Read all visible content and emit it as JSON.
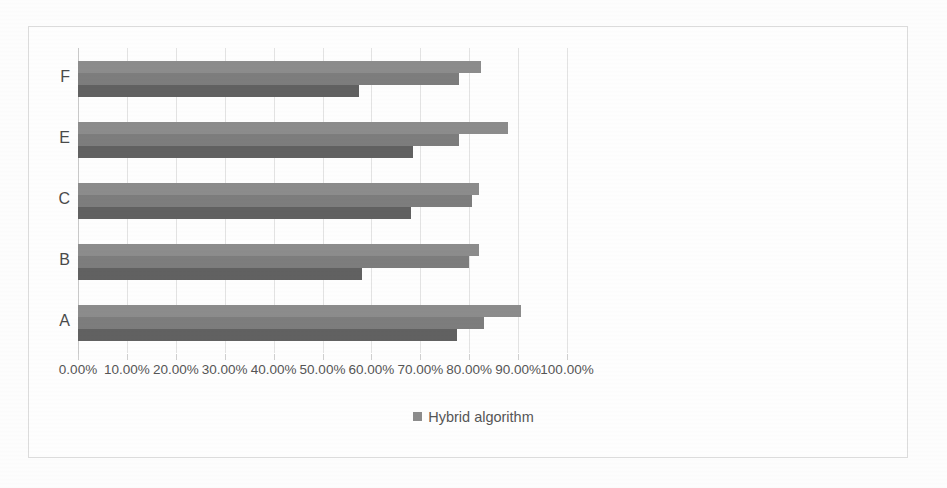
{
  "chart_data": {
    "type": "bar",
    "orientation": "horizontal",
    "title": "",
    "xlabel": "",
    "ylabel": "",
    "xlim": [
      0,
      100
    ],
    "xtick_labels": [
      "0.00%",
      "10.00%",
      "20.00%",
      "30.00%",
      "40.00%",
      "50.00%",
      "60.00%",
      "70.00%",
      "80.00%",
      "90.00%",
      "100.00%"
    ],
    "xtick_values": [
      0,
      10,
      20,
      30,
      40,
      50,
      60,
      70,
      80,
      90,
      100
    ],
    "grid": true,
    "categories": [
      "F",
      "E",
      "C",
      "B",
      "A"
    ],
    "legend": {
      "position": "bottom",
      "entries": [
        "Hybrid algorithm"
      ]
    },
    "series": [
      {
        "name": "Hybrid algorithm",
        "color": "#8c8c8c",
        "values": [
          82.5,
          88.0,
          82.0,
          82.0,
          90.5
        ]
      },
      {
        "name": "series-2",
        "color": "#7d7d7d",
        "values": [
          78.0,
          78.0,
          80.5,
          80.0,
          83.0
        ]
      },
      {
        "name": "series-3",
        "color": "#616161",
        "values": [
          57.5,
          68.5,
          68.0,
          58.0,
          77.5
        ]
      }
    ]
  },
  "axis": {
    "tick_0": "0.00%",
    "tick_1": "10.00%",
    "tick_2": "20.00%",
    "tick_3": "30.00%",
    "tick_4": "40.00%",
    "tick_5": "50.00%",
    "tick_6": "60.00%",
    "tick_7": "70.00%",
    "tick_8": "80.00%",
    "tick_9": "90.00%",
    "tick_10": "100.00%"
  },
  "categories": {
    "c0": "F",
    "c1": "E",
    "c2": "C",
    "c3": "B",
    "c4": "A"
  },
  "legend": {
    "label": "Hybrid algorithm"
  },
  "colors": {
    "series_1": "#8c8c8c",
    "series_2": "#7d7d7d",
    "series_3": "#616161",
    "grid": "#e3e3e3",
    "text": "#555555",
    "frame": "#dcdcdc"
  }
}
